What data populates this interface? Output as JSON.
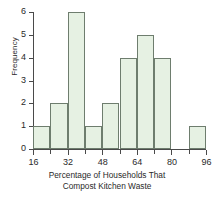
{
  "chart_data": {
    "type": "bar",
    "title": "",
    "subtitle": "",
    "xlabel_line1": "Percentage of Households That",
    "xlabel_line2": "Compost Kitchen Waste",
    "ylabel": "Frequency",
    "bin_width": 8,
    "xlim": [
      16,
      96
    ],
    "ylim": [
      0,
      6
    ],
    "grid": false,
    "legend": false,
    "x_major_ticks": [
      16,
      32,
      48,
      64,
      80,
      96
    ],
    "x_minor_ticks": [
      24,
      40,
      56,
      72,
      88
    ],
    "x_tick_labels": [
      "16",
      "32",
      "48",
      "64",
      "80",
      "96"
    ],
    "y_ticks": [
      0,
      1,
      2,
      3,
      4,
      5,
      6
    ],
    "y_tick_labels": [
      "0",
      "1",
      "2",
      "3",
      "4",
      "5",
      "6"
    ],
    "categories": [
      "16-24",
      "24-32",
      "32-40",
      "40-48",
      "48-56",
      "56-64",
      "64-72",
      "72-80",
      "80-88",
      "88-96"
    ],
    "bin_edges": [
      16,
      24,
      32,
      40,
      48,
      56,
      64,
      72,
      80,
      88,
      96
    ],
    "values": [
      1,
      2,
      6,
      1,
      2,
      4,
      5,
      4,
      0,
      1
    ],
    "colors": {
      "bar_fill": "#e6f1e3",
      "bar_edge": "#6e7d6e",
      "axis": "#4a4a4a",
      "text": "#2a2a2a",
      "background": "#ffffff"
    }
  }
}
